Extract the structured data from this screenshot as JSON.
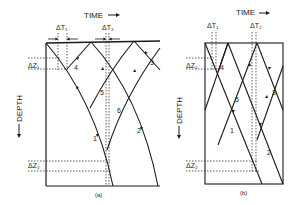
{
  "figure": {
    "panels": [
      {
        "id": "a",
        "caption": "(a)",
        "time_label": "TIME",
        "depth_label": "DEPTH",
        "delta_t1": "ΔT₁",
        "delta_t2": "ΔT₂",
        "delta_z1": "ΔZ₁",
        "delta_z2": "ΔZ₂",
        "ray_labels": [
          "1",
          "2",
          "3",
          "4",
          "5",
          "6"
        ]
      },
      {
        "id": "b",
        "caption": "(b)",
        "time_label": "TIME",
        "depth_label": "DEPTH",
        "delta_t1": "ΔT₁",
        "delta_t2": "ΔT₂",
        "delta_z1": "ΔZ₁",
        "delta_z2": "ΔZ₂",
        "ray_labels": [
          "1",
          "2",
          "3",
          "4",
          "5"
        ]
      }
    ],
    "colors": {
      "ink": "#1a1a1a",
      "background": "#ffffff"
    }
  }
}
